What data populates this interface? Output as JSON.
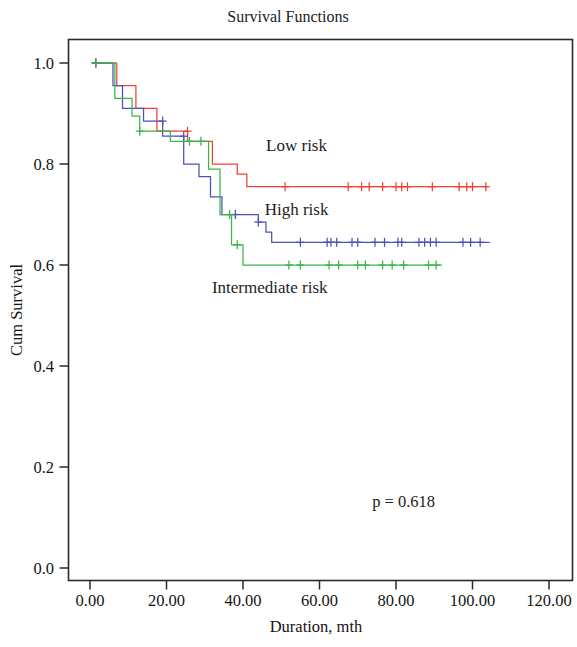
{
  "chart_data": {
    "type": "line",
    "title": "Survival Functions",
    "xlabel": "Duration, mth",
    "ylabel": "Cum Survival",
    "xlim": [
      0,
      120
    ],
    "ylim": [
      0.0,
      1.0
    ],
    "xticks": [
      "0.00",
      "20.00",
      "40.00",
      "60.00",
      "80.00",
      "100.00",
      "120.00"
    ],
    "xtick_values": [
      0,
      20,
      40,
      60,
      80,
      100,
      120
    ],
    "yticks": [
      "0.0",
      "0.2",
      "0.4",
      "0.6",
      "0.8",
      "1.0"
    ],
    "ytick_values": [
      0.0,
      0.2,
      0.4,
      0.6,
      0.8,
      1.0
    ],
    "grid": false,
    "legend_position": "inline-annotations",
    "annotations": [
      {
        "name": "p-value",
        "text": "p = 0.618",
        "x": 82,
        "y": 0.12
      },
      {
        "name": "low-risk-label",
        "text": "Low risk",
        "x": 54,
        "y": 0.825
      },
      {
        "name": "high-risk-label",
        "text": "High risk",
        "x": 54,
        "y": 0.7
      },
      {
        "name": "intermediate-risk-label",
        "text": "Intermediate risk",
        "x": 47,
        "y": 0.545
      }
    ],
    "series": [
      {
        "name": "Low risk",
        "color": "#ef4136",
        "steps": [
          [
            1.5,
            1.0
          ],
          [
            7.0,
            1.0
          ],
          [
            7.0,
            0.955
          ],
          [
            12.0,
            0.955
          ],
          [
            12.0,
            0.91
          ],
          [
            17.5,
            0.91
          ],
          [
            17.5,
            0.865
          ],
          [
            25.5,
            0.865
          ],
          [
            25.5,
            0.845
          ],
          [
            32.0,
            0.845
          ],
          [
            32.0,
            0.8
          ],
          [
            38.5,
            0.8
          ],
          [
            38.5,
            0.78
          ],
          [
            41.0,
            0.78
          ],
          [
            41.0,
            0.755
          ],
          [
            46.5,
            0.755
          ],
          [
            46.5,
            0.755
          ],
          [
            104.0,
            0.755
          ]
        ],
        "censored": [
          [
            1.5,
            1.0
          ],
          [
            25.5,
            0.865
          ],
          [
            51.0,
            0.755
          ],
          [
            67.5,
            0.755
          ],
          [
            71.0,
            0.755
          ],
          [
            73.0,
            0.755
          ],
          [
            76.5,
            0.755
          ],
          [
            80.0,
            0.755
          ],
          [
            81.5,
            0.755
          ],
          [
            83.0,
            0.755
          ],
          [
            89.5,
            0.755
          ],
          [
            96.5,
            0.755
          ],
          [
            98.5,
            0.755
          ],
          [
            100.0,
            0.755
          ],
          [
            103.5,
            0.755
          ]
        ]
      },
      {
        "name": "High risk",
        "color": "#4c52b5",
        "steps": [
          [
            1.5,
            1.0
          ],
          [
            6.0,
            1.0
          ],
          [
            6.0,
            0.955
          ],
          [
            8.5,
            0.955
          ],
          [
            8.5,
            0.91
          ],
          [
            14.0,
            0.91
          ],
          [
            14.0,
            0.885
          ],
          [
            19.0,
            0.885
          ],
          [
            19.0,
            0.855
          ],
          [
            24.5,
            0.855
          ],
          [
            24.5,
            0.8
          ],
          [
            28.5,
            0.8
          ],
          [
            28.5,
            0.775
          ],
          [
            31.5,
            0.775
          ],
          [
            31.5,
            0.735
          ],
          [
            34.5,
            0.735
          ],
          [
            34.5,
            0.7
          ],
          [
            38.0,
            0.7
          ],
          [
            38.0,
            0.7
          ],
          [
            44.0,
            0.7
          ],
          [
            44.0,
            0.685
          ],
          [
            46.0,
            0.685
          ],
          [
            46.0,
            0.665
          ],
          [
            47.5,
            0.665
          ],
          [
            47.5,
            0.645
          ],
          [
            50.5,
            0.645
          ],
          [
            104.5,
            0.645
          ]
        ],
        "censored": [
          [
            1.5,
            1.0
          ],
          [
            19.0,
            0.885
          ],
          [
            24.5,
            0.855
          ],
          [
            38.0,
            0.7
          ],
          [
            44.0,
            0.685
          ],
          [
            55.0,
            0.645
          ],
          [
            62.0,
            0.645
          ],
          [
            63.0,
            0.645
          ],
          [
            64.5,
            0.645
          ],
          [
            68.5,
            0.645
          ],
          [
            70.0,
            0.645
          ],
          [
            74.5,
            0.645
          ],
          [
            77.0,
            0.645
          ],
          [
            80.5,
            0.645
          ],
          [
            81.5,
            0.645
          ],
          [
            86.0,
            0.645
          ],
          [
            87.5,
            0.645
          ],
          [
            89.0,
            0.645
          ],
          [
            90.5,
            0.645
          ],
          [
            97.5,
            0.645
          ],
          [
            99.5,
            0.645
          ],
          [
            102.0,
            0.645
          ]
        ]
      },
      {
        "name": "Intermediate risk",
        "color": "#3ab54a",
        "steps": [
          [
            1.5,
            1.0
          ],
          [
            6.5,
            1.0
          ],
          [
            6.5,
            0.93
          ],
          [
            11.0,
            0.93
          ],
          [
            11.0,
            0.895
          ],
          [
            13.0,
            0.895
          ],
          [
            13.0,
            0.865
          ],
          [
            21.0,
            0.865
          ],
          [
            21.0,
            0.845
          ],
          [
            26.0,
            0.845
          ],
          [
            26.0,
            0.845
          ],
          [
            31.0,
            0.845
          ],
          [
            31.0,
            0.79
          ],
          [
            34.0,
            0.79
          ],
          [
            34.0,
            0.7
          ],
          [
            37.0,
            0.7
          ],
          [
            37.0,
            0.64
          ],
          [
            40.0,
            0.64
          ],
          [
            40.0,
            0.6
          ],
          [
            45.0,
            0.6
          ],
          [
            92.0,
            0.6
          ]
        ],
        "censored": [
          [
            1.5,
            1.0
          ],
          [
            13.0,
            0.865
          ],
          [
            26.0,
            0.845
          ],
          [
            29.0,
            0.845
          ],
          [
            36.5,
            0.7
          ],
          [
            38.5,
            0.64
          ],
          [
            52.0,
            0.6
          ],
          [
            55.0,
            0.6
          ],
          [
            62.5,
            0.6
          ],
          [
            65.0,
            0.6
          ],
          [
            70.0,
            0.6
          ],
          [
            72.0,
            0.6
          ],
          [
            76.5,
            0.6
          ],
          [
            79.0,
            0.6
          ],
          [
            82.0,
            0.6
          ],
          [
            88.5,
            0.6
          ],
          [
            90.5,
            0.6
          ]
        ]
      }
    ]
  }
}
